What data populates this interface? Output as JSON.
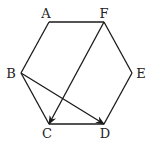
{
  "diagram": {
    "type": "regular-hexagon-with-vectors",
    "vertices": [
      {
        "name": "A",
        "label": "A",
        "x": 49,
        "y": 22,
        "lx": 46,
        "ly": 18
      },
      {
        "name": "F",
        "label": "F",
        "x": 104,
        "y": 22,
        "lx": 104,
        "ly": 18
      },
      {
        "name": "E",
        "label": "E",
        "x": 132,
        "y": 73,
        "lx": 141,
        "ly": 78
      },
      {
        "name": "D",
        "label": "D",
        "x": 104,
        "y": 124,
        "lx": 105,
        "ly": 138
      },
      {
        "name": "C",
        "label": "C",
        "x": 49,
        "y": 124,
        "lx": 47,
        "ly": 138
      },
      {
        "name": "B",
        "label": "B",
        "x": 21,
        "y": 73,
        "lx": 11,
        "ly": 78
      }
    ],
    "edges": [
      [
        "A",
        "F"
      ],
      [
        "F",
        "E"
      ],
      [
        "E",
        "D"
      ],
      [
        "D",
        "C"
      ],
      [
        "C",
        "B"
      ],
      [
        "B",
        "A"
      ]
    ],
    "vectors": [
      {
        "from": "F",
        "to": "C",
        "label": "vector FC"
      },
      {
        "from": "B",
        "to": "D",
        "label": "vector BD"
      }
    ],
    "colors": {
      "stroke": "#1a1a1a",
      "text": "#222222",
      "background": "#ffffff"
    }
  }
}
